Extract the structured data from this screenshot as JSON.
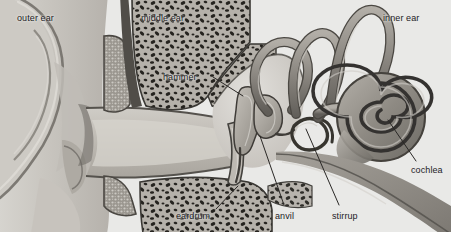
{
  "figure": {
    "style": "grayscale anatomical illustration",
    "background_color": "#e9e9e7",
    "label_color": "#23211f",
    "leader_line_color": "#2a2826"
  },
  "region_labels": [
    {
      "id": "outer-ear",
      "text": "outer ear",
      "x": 17,
      "y": 13
    },
    {
      "id": "middle-ear",
      "text": "middle ear",
      "x": 141,
      "y": 13
    },
    {
      "id": "inner-ear",
      "text": "inner ear",
      "x": 383,
      "y": 13
    }
  ],
  "part_labels": [
    {
      "id": "hammer",
      "text": "hammer",
      "x": 163,
      "y": 72,
      "leader": {
        "x1": 213,
        "y1": 77,
        "x2": 243,
        "y2": 96
      }
    },
    {
      "id": "eardrum",
      "text": "eardrum",
      "x": 176,
      "y": 211,
      "leader": {
        "x1": 216,
        "y1": 209,
        "x2": 238,
        "y2": 186
      }
    },
    {
      "id": "anvil",
      "text": "anvil",
      "x": 275,
      "y": 211,
      "leader": {
        "x1": 284,
        "y1": 205,
        "x2": 260,
        "y2": 136
      }
    },
    {
      "id": "stirrup",
      "text": "stirrup",
      "x": 332,
      "y": 211,
      "leader": {
        "x1": 339,
        "y1": 205,
        "x2": 306,
        "y2": 129
      }
    },
    {
      "id": "cochlea",
      "text": "cochlea",
      "x": 411,
      "y": 165,
      "leader": {
        "x1": 416,
        "y1": 161,
        "x2": 388,
        "y2": 120
      }
    }
  ],
  "anatomy_parts": [
    "pinna (auricle)",
    "ear canal",
    "eardrum (tympanic membrane)",
    "hammer (malleus)",
    "anvil (incus)",
    "stirrup (stapes)",
    "semicircular canals",
    "cochlea",
    "auditory nerve",
    "eustachian tube",
    "temporal bone (cancellous)"
  ]
}
